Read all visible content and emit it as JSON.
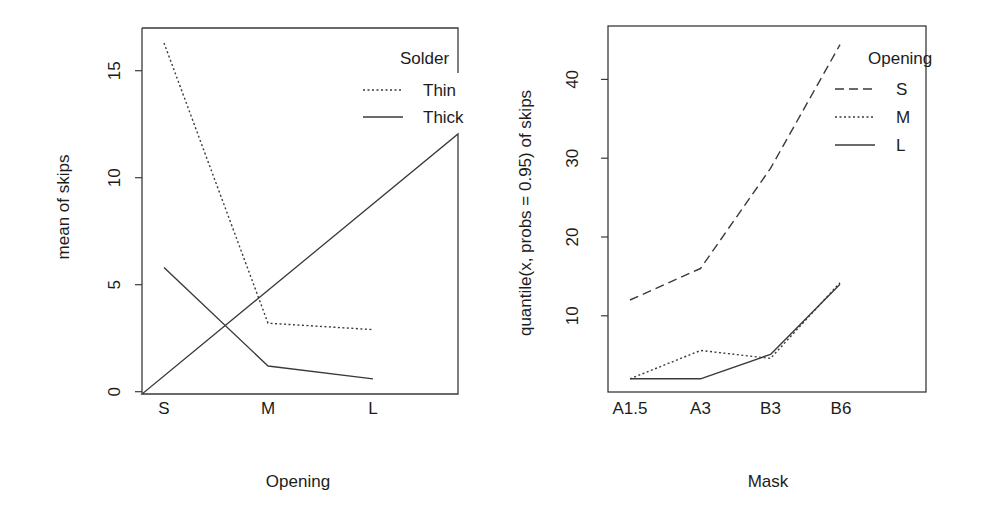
{
  "chart_data": [
    {
      "type": "line",
      "title": "",
      "xlabel": "Opening",
      "ylabel": "mean of skips",
      "categories": [
        "S",
        "M",
        "L"
      ],
      "yticks": [
        0,
        5,
        10,
        15
      ],
      "ylim": [
        0,
        16.6
      ],
      "grid": false,
      "legend": {
        "title": "Solder",
        "position": "top-right",
        "entries": [
          {
            "label": "Thin",
            "linestyle": "dotted"
          },
          {
            "label": "Thick",
            "linestyle": "solid"
          }
        ]
      },
      "series": [
        {
          "name": "Thin",
          "linestyle": "dotted",
          "values": [
            16.3,
            3.2,
            2.9
          ]
        },
        {
          "name": "Thick",
          "linestyle": "solid",
          "values": [
            5.8,
            1.2,
            0.6
          ]
        }
      ]
    },
    {
      "type": "line",
      "title": "",
      "xlabel": "Mask",
      "ylabel": "quantile(x, probs = 0.95) of skips",
      "categories": [
        "A1.5",
        "A3",
        "B3",
        "B6"
      ],
      "yticks": [
        10,
        20,
        30,
        40
      ],
      "ylim": [
        2,
        44.5
      ],
      "grid": false,
      "legend": {
        "title": "Opening",
        "position": "top-right",
        "entries": [
          {
            "label": "S",
            "linestyle": "dashed"
          },
          {
            "label": "M",
            "linestyle": "dotted"
          },
          {
            "label": "L",
            "linestyle": "solid"
          }
        ]
      },
      "series": [
        {
          "name": "S",
          "linestyle": "dashed",
          "values": [
            12.0,
            16.0,
            28.7,
            44.4
          ]
        },
        {
          "name": "M",
          "linestyle": "dotted",
          "values": [
            2.0,
            5.6,
            4.6,
            14.2
          ]
        },
        {
          "name": "L",
          "linestyle": "solid",
          "values": [
            2.0,
            2.0,
            5.1,
            14.0
          ]
        }
      ]
    }
  ],
  "colors": {
    "line": "#3a3a3a",
    "text": "#1c1c1c",
    "background": "#ffffff"
  }
}
